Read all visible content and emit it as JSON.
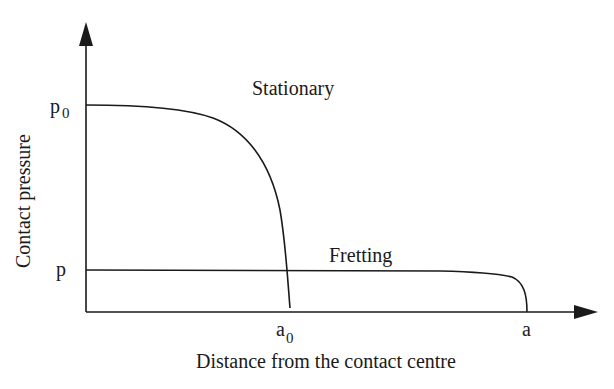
{
  "diagram": {
    "y_axis_label": "Contact pressure",
    "x_axis_label": "Distance from the contact centre",
    "y_ticks": [
      {
        "base": "p",
        "sub": "0"
      },
      {
        "base": "p",
        "sub": ""
      }
    ],
    "x_ticks": [
      {
        "base": "a",
        "sub": "0"
      },
      {
        "base": "a",
        "sub": ""
      }
    ],
    "curves": [
      {
        "name": "Stationary",
        "peak_pressure": "p0",
        "contact_radius": "a0"
      },
      {
        "name": "Fretting",
        "peak_pressure": "p",
        "contact_radius": "a"
      }
    ]
  }
}
